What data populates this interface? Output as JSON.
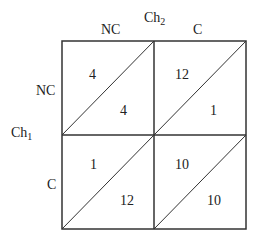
{
  "axes": {
    "top_player": {
      "name": "Ch",
      "sub": "2"
    },
    "left_player": {
      "name": "Ch",
      "sub": "1"
    },
    "columns": [
      "NC",
      "C"
    ],
    "rows": [
      "NC",
      "C"
    ]
  },
  "cells": [
    [
      {
        "upper": "4",
        "lower": "4"
      },
      {
        "upper": "12",
        "lower": "1"
      }
    ],
    [
      {
        "upper": "1",
        "lower": "12"
      },
      {
        "upper": "10",
        "lower": "10"
      }
    ]
  ]
}
